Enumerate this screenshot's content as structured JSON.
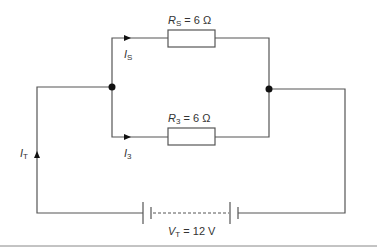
{
  "diagram": {
    "resistors": [
      {
        "id": "top",
        "symbol": "R",
        "subscript": "S",
        "equals": " = ",
        "value": "6 Ω"
      },
      {
        "id": "bottom",
        "symbol": "R",
        "subscript": "3",
        "equals": " = ",
        "value": "6 Ω"
      }
    ],
    "currents": [
      {
        "id": "top-branch",
        "symbol": "I",
        "subscript": "S"
      },
      {
        "id": "bottom-branch",
        "symbol": "I",
        "subscript": "3"
      },
      {
        "id": "total",
        "symbol": "I",
        "subscript": "T"
      }
    ],
    "source": {
      "symbol": "V",
      "subscript": "T",
      "equals": " = ",
      "value": "12 V"
    },
    "colors": {
      "wire": "#555555",
      "node": "#111111",
      "text": "#333333"
    }
  }
}
